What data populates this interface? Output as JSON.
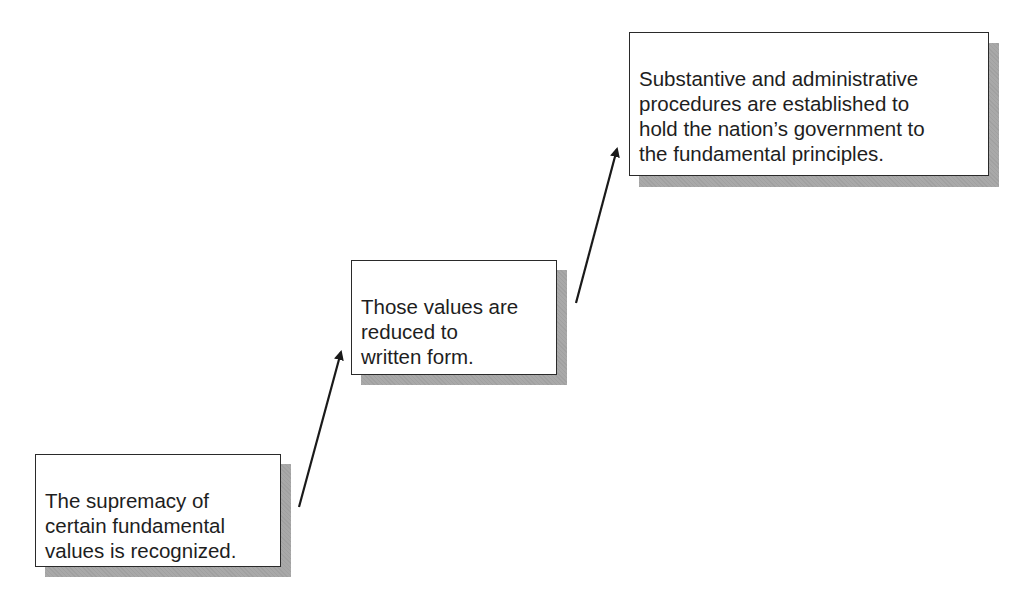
{
  "diagram": {
    "type": "staircase-flow",
    "steps": [
      {
        "id": 1,
        "text": "The supremacy of\ncertain fundamental\nvalues is recognized."
      },
      {
        "id": 2,
        "text": "Those values are\nreduced to\nwritten form."
      },
      {
        "id": 3,
        "text": "Substantive and administrative\nprocedures are established to\nhold the nation’s government to\nthe fundamental principles."
      }
    ],
    "arrows": [
      {
        "from": 1,
        "to": 2
      },
      {
        "from": 2,
        "to": 3
      }
    ],
    "colors": {
      "box_border": "#2a2a2a",
      "shadow": "#a9a9a9",
      "text": "#1e1e1e",
      "arrow": "#1a1a1a"
    }
  }
}
